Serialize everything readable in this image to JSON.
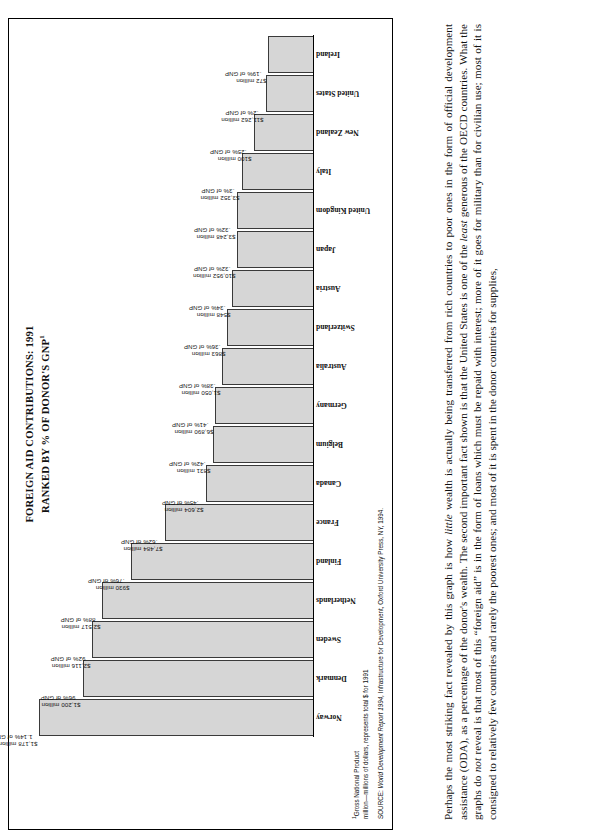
{
  "figure": {
    "title_line1": "FOREIGN AID CONTRIBUTIONS: 1991",
    "title_line2": "RANKED BY % OF DONOR'S GNP",
    "title_superscript": "1",
    "footnote_marker": "1",
    "footnote_line1": "Gross National Product",
    "footnote_line2": "million—millions of dollars, represents total $ for 1991",
    "source_prefix": "SOURCE:  ",
    "source_italic": "World Development Report 1994,",
    "source_rest": " Infrastructure for Development, Oxford University Press, NY, 1994.",
    "bar_fill_color": "#d6d6d6",
    "bar_stroke_color": "#3a3a3a"
  },
  "chart_data": {
    "type": "bar",
    "title": "FOREIGN AID CONTRIBUTIONS: 1991 RANKED BY % OF DONOR'S GNP",
    "xlabel": "",
    "ylabel": "% of donor's GNP",
    "ylim": [
      0,
      1.2
    ],
    "grid": false,
    "legend": "none",
    "orientation": "vertical-bars-ranked-descending",
    "categories": [
      "Norway",
      "Denmark",
      "Sweden",
      "Netherlands",
      "Finland",
      "France",
      "Canada",
      "Belgium",
      "Germany",
      "Australia",
      "Switzerland",
      "Austria",
      "Japan",
      "United Kingdom",
      "Italy",
      "New Zealand",
      "United States",
      "Ireland"
    ],
    "values": [
      1.14,
      0.96,
      0.92,
      0.88,
      0.76,
      0.62,
      0.45,
      0.42,
      0.41,
      0.38,
      0.36,
      0.34,
      0.32,
      0.32,
      0.3,
      0.25,
      0.2,
      0.19
    ],
    "value_labels": [
      "1.14% of GNP",
      "96% of GNP",
      "92% of GNP",
      "88% of GNP",
      ".76% of GNP",
      ".62% of GNP",
      ".45% of GNP",
      ".42% of GNP",
      ".41% of GNP",
      ".38% of GNP",
      ".36% of GNP",
      ".34% of GNP",
      ".32% of GNP",
      ".32% of GNP",
      ".3% of GNP",
      ".25% of GNP",
      ".2% of GNP",
      ".19% of GNP"
    ],
    "amount_labels": [
      "$1,178 million",
      "$1,200 million",
      "$2,116 million",
      "$2,517 million",
      "$930 million",
      "$7,484 million",
      "$2,604 million",
      "$831 million",
      "$6,890 million",
      "$1,050 million",
      "$863 million",
      "$548 million",
      "$10,952 million",
      "$3,248 million",
      "$3,352 million",
      "$100 million",
      "$11,262 million",
      "$72 million"
    ],
    "bars": [
      {
        "country": "Norway",
        "amount": "$1,178 million",
        "percent": "1.14% of GNP",
        "value": 1.14
      },
      {
        "country": "Denmark",
        "amount": "$1,200 million",
        "percent": "96% of GNP",
        "value": 0.96
      },
      {
        "country": "Sweden",
        "amount": "$2,116 million",
        "percent": "92% of GNP",
        "value": 0.92
      },
      {
        "country": "Netherlands",
        "amount": "$2,517 million",
        "percent": "88% of GNP",
        "value": 0.88
      },
      {
        "country": "Finland",
        "amount": "$930 million",
        "percent": ".76% of GNP",
        "value": 0.76
      },
      {
        "country": "France",
        "amount": "$7,484 million",
        "percent": ".62% of GNP",
        "value": 0.62
      },
      {
        "country": "Canada",
        "amount": "$2,604 million",
        "percent": ".45% of GNP",
        "value": 0.45
      },
      {
        "country": "Belgium",
        "amount": "$831 million",
        "percent": ".42% of GNP",
        "value": 0.42
      },
      {
        "country": "Germany",
        "amount": "$6,890 million",
        "percent": ".41% of GNP",
        "value": 0.41
      },
      {
        "country": "Australia",
        "amount": "$1,050 million",
        "percent": ".38% of GNP",
        "value": 0.38
      },
      {
        "country": "Switzerland",
        "amount": "$863 million",
        "percent": ".36% of GNP",
        "value": 0.36
      },
      {
        "country": "Austria",
        "amount": "$548 million",
        "percent": ".34% of GNP",
        "value": 0.34
      },
      {
        "country": "Japan",
        "amount": "$10,952 million",
        "percent": ".32% of GNP",
        "value": 0.32
      },
      {
        "country": "United Kingdom",
        "amount": "$3,248 million",
        "percent": ".32% of GNP",
        "value": 0.32
      },
      {
        "country": "Italy",
        "amount": "$3,352 million",
        "percent": ".3% of GNP",
        "value": 0.3
      },
      {
        "country": "New Zealand",
        "amount": "$100 million",
        "percent": ".25% of GNP",
        "value": 0.25
      },
      {
        "country": "United States",
        "amount": "$11,262 million",
        "percent": ".2% of GNP",
        "value": 0.2
      },
      {
        "country": "Ireland",
        "amount": "$72 million",
        "percent": ".19% of GNP",
        "value": 0.19
      }
    ]
  },
  "body": {
    "paragraph_part1": "Perhaps the most striking fact revealed by this graph is how ",
    "paragraph_italic1": "little",
    "paragraph_part2": " wealth is actually being transferred from rich countries to poor ones in the form of official development assistance (ODA), as a percentage of the donor's wealth. The second important fact shown is that the United States is one of the ",
    "paragraph_italic2": "least",
    "paragraph_part3": " generous of the OECD countries. What the graphs do ",
    "paragraph_italic3": "not",
    "paragraph_part4": " reveal is that most of this “foreign aid” is in the form of loans which must be repaid with interest; more of it goes for military than for civilian use; most of it is consigned to relatively few countries and rarely the poorest ones; and most of it is spent in the donor countries for supplies,"
  }
}
